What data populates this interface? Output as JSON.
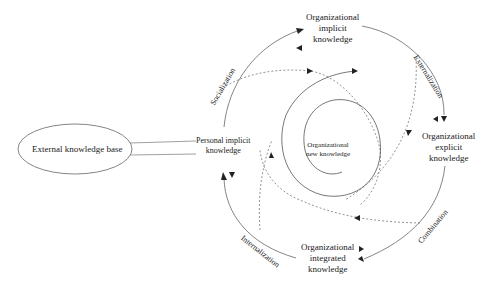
{
  "diagram": {
    "type": "knowledge-creation-spiral (SECI)",
    "nodes": {
      "external": "External knowledge base",
      "personal_implicit": [
        "Personal implicit",
        "knowledge"
      ],
      "org_implicit": [
        "Organizational",
        "implicit",
        "knowledge"
      ],
      "org_explicit": [
        "Organizational",
        "explicit",
        "knowledge"
      ],
      "org_integrated": [
        "Organizational",
        "integrated",
        "knowledge"
      ],
      "org_new": [
        "Organizational",
        "new knowledge"
      ]
    },
    "phases": {
      "socialization": "Socialization",
      "externalization": "Externalization",
      "combination": "Combination",
      "internalization": "Internalization"
    },
    "edges": [
      {
        "from": "External knowledge base",
        "to": "Personal implicit knowledge",
        "style": "double-line"
      },
      {
        "from": "Personal implicit knowledge",
        "to": "Organizational implicit knowledge",
        "label": "Socialization",
        "style": "solid-arc"
      },
      {
        "from": "Organizational implicit knowledge",
        "to": "Organizational explicit knowledge",
        "label": "Externalization",
        "style": "solid-arc"
      },
      {
        "from": "Organizational explicit knowledge",
        "to": "Organizational integrated knowledge",
        "label": "Combination",
        "style": "solid-arc"
      },
      {
        "from": "Organizational integrated knowledge",
        "to": "Personal implicit knowledge",
        "label": "Internalization",
        "style": "solid-arc"
      },
      {
        "from": "Personal implicit knowledge",
        "to": "Organizational new knowledge",
        "style": "dashed-spiral"
      }
    ],
    "colors": {
      "stroke": "#555555",
      "text": "#222222",
      "background": "#ffffff"
    }
  }
}
